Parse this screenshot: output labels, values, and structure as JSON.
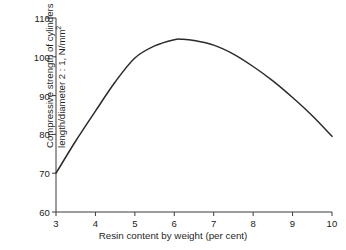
{
  "chart_data": {
    "type": "line",
    "title": "",
    "xlabel": "Resin content by weight (per cent)",
    "ylabel_line1": "Compressive strength of cylinders",
    "ylabel_line2_pre": "length/diameter 2 : 1, N/mm",
    "ylabel_line2_sup": "2",
    "xlim": [
      3,
      10
    ],
    "ylim": [
      60,
      110
    ],
    "xticks": [
      "3",
      "4",
      "5",
      "6",
      "7",
      "8",
      "9",
      "10"
    ],
    "xtick_values": [
      3,
      4,
      5,
      6,
      7,
      8,
      9,
      10
    ],
    "yticks": [
      "60",
      "70",
      "80",
      "90",
      "100",
      "110"
    ],
    "ytick_values": [
      60,
      70,
      80,
      90,
      100,
      110
    ],
    "grid": false,
    "legend": "none",
    "series": [
      {
        "name": "Compressive strength",
        "color": "#2b2b2b",
        "x": [
          3.0,
          3.5,
          4.0,
          4.5,
          5.0,
          5.5,
          6.0,
          6.2,
          6.5,
          7.0,
          7.5,
          8.0,
          8.5,
          9.0,
          9.5,
          10.0
        ],
        "y": [
          70.0,
          78.3,
          86.0,
          93.5,
          99.7,
          102.8,
          104.4,
          104.5,
          104.2,
          103.0,
          100.7,
          97.5,
          93.8,
          89.5,
          84.8,
          79.5
        ]
      }
    ],
    "annotations": {
      "peak_x": 6.2,
      "peak_y": 104.5,
      "start_point": [
        3,
        70
      ],
      "end_point": [
        10,
        79.5
      ]
    }
  }
}
